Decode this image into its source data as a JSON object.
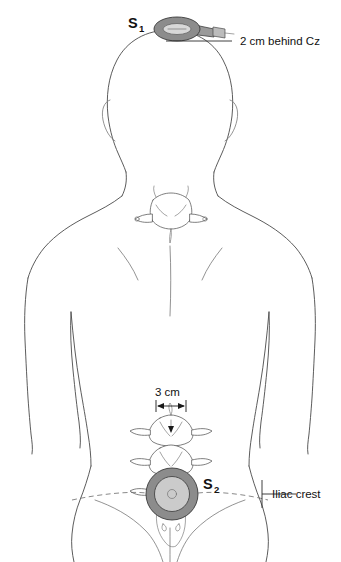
{
  "figure": {
    "view": "posterior",
    "background_color": "#ffffff",
    "line_color": "#4a4a4a"
  },
  "sites": [
    {
      "id": "S1",
      "label": "S",
      "subscript": "1",
      "coil_type": "circular coil with handle",
      "coil_orientation": "oblique",
      "location": "vertex of scalp",
      "annotation": "2 cm behind Cz",
      "coil_fill": "#8c8c8c",
      "coil_core_fill": "#d8d8d8"
    },
    {
      "id": "S2",
      "label": "S",
      "subscript": "2",
      "coil_type": "circular coil",
      "coil_orientation": "face-on",
      "location": "lumbar spine",
      "annotation": "Iliac crest",
      "coil_fill": "#8c8c8c",
      "coil_core_fill": "#d8d8d8"
    }
  ],
  "annotations": {
    "cz_label": "2 cm behind Cz",
    "iliac_label": "Iliac crest",
    "distance_label": "3 cm"
  },
  "measurements": {
    "scalp_offset": "2 cm behind Cz",
    "lumbar_offset": "3 cm",
    "reference_line": "Iliac crest"
  },
  "anatomy": {
    "cervical_vertebra": "C7 vertebra",
    "lumbar_vertebrae": "lumbar vertebral column",
    "pelvis": "pelvic outline"
  }
}
